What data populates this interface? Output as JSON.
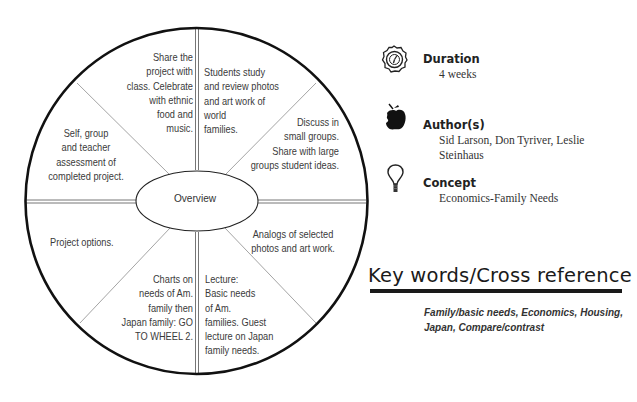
{
  "wheel": {
    "center_label": "Overview",
    "segments": [
      {
        "position": "top-left-inner",
        "text": "Share the\nproject with\nclass. Celebrate\nwith ethnic\nfood and\nmusic."
      },
      {
        "position": "top-right-inner",
        "text": "Students study\nand review photos\nand art work of\nworld\nfamilies."
      },
      {
        "position": "upper-right",
        "text": "Discuss in\nsmall groups.\nShare with large\ngroups student ideas."
      },
      {
        "position": "lower-right",
        "text": "Analogs of selected\nphotos and art work."
      },
      {
        "position": "bottom-right-inner",
        "text": "Lecture:\nBasic needs\nof Am.\nfamilies. Guest\nlecture on Japan\nfamily needs."
      },
      {
        "position": "bottom-left-inner",
        "text": "Charts on\nneeds of Am.\nfamily then\nJapan family: GO\nTO WHEEL 2."
      },
      {
        "position": "lower-left",
        "text": "Project options."
      },
      {
        "position": "upper-left",
        "text": "Self, group\nand teacher\nassessment of\ncompleted project."
      }
    ]
  },
  "info": {
    "duration": {
      "icon": "clock-icon",
      "label": "Duration",
      "value": "4 weeks"
    },
    "authors": {
      "icon": "apple-icon",
      "label": "Author(s)",
      "value": "Sid Larson, Don Tyriver, Leslie Steinhaus"
    },
    "concept": {
      "icon": "lightbulb-icon",
      "label": "Concept",
      "value": "Economics-Family Needs"
    }
  },
  "keywords": {
    "title": "Key words/Cross reference",
    "text": "Family/basic needs, Economics, Housing, Japan, Compare/contrast"
  }
}
